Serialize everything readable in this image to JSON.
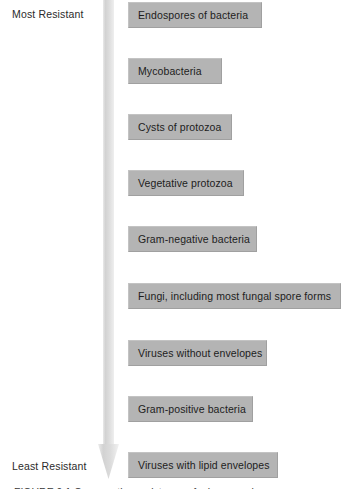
{
  "figure": {
    "axis": {
      "top_label": "Most Resistant",
      "bottom_label": "Least Resistant",
      "arrow_direction": "down",
      "arrow_color": "#d4d4d4"
    },
    "box_color": "#b4b4b4",
    "items": [
      {
        "label": "Endospores of bacteria",
        "top": 2,
        "width": 134
      },
      {
        "label": "Mycobacteria",
        "top": 58,
        "width": 94
      },
      {
        "label": "Cysts of protozoa",
        "top": 114,
        "width": 104
      },
      {
        "label": "Vegetative protozoa",
        "top": 170,
        "width": 116
      },
      {
        "label": "Gram-negative bacteria",
        "top": 226,
        "width": 129
      },
      {
        "label": "Fungi, including most fungal spore forms",
        "top": 283,
        "width": 213
      },
      {
        "label": "Viruses without envelopes",
        "top": 340,
        "width": 139
      },
      {
        "label": "Gram-positive bacteria",
        "top": 396,
        "width": 125
      },
      {
        "label": "Viruses with lipid envelopes",
        "top": 452,
        "width": 150
      }
    ],
    "caption": "FIGURE 9.1  Comparative resistance of microorganisms"
  }
}
